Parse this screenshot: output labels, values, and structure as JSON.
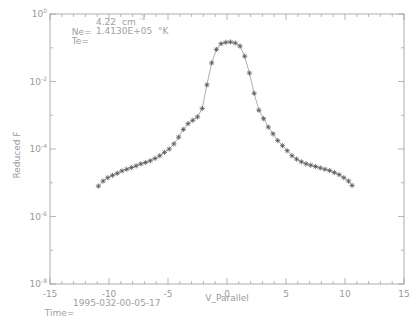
{
  "chart_data": {
    "type": "scatter",
    "title": "",
    "xlabel": "V_Parallel",
    "ylabel": "Reduced F",
    "xlim": [
      -15,
      15
    ],
    "ylim_log10": [
      -8,
      0
    ],
    "yscale": "log",
    "grid": false,
    "legend": null,
    "x_ticks": [
      -15,
      -10,
      -5,
      0,
      5,
      10,
      15
    ],
    "x_tick_labels": [
      "-15",
      "-10",
      "-5",
      "0",
      "5",
      "10",
      "15"
    ],
    "y_ticks_log10": [
      0,
      -2,
      -4,
      -6,
      -8
    ],
    "y_tick_labels": [
      "10^0",
      "10^-2",
      "10^-4",
      "10^-6",
      "10^-8"
    ],
    "annotations": {
      "ne_label": "Ne=",
      "ne_value": "4.22",
      "ne_unit": "cm",
      "ne_exp": "-3",
      "te_label": "Te=",
      "te_value": "1.4130E+05",
      "te_unit": "°K",
      "time_label": "Time=",
      "time_value": "1995-032-00-05-17"
    },
    "series": [
      {
        "name": "data",
        "marker": "asterisk",
        "line": true,
        "x": [
          -10.9,
          -10.5,
          -10.1,
          -9.7,
          -9.3,
          -8.9,
          -8.5,
          -8.1,
          -7.7,
          -7.3,
          -6.9,
          -6.5,
          -6.1,
          -5.7,
          -5.3,
          -4.9,
          -4.5,
          -4.1,
          -3.7,
          -3.3,
          -2.9,
          -2.5,
          -2.1,
          -1.7,
          -1.3,
          -0.9,
          -0.5,
          -0.1,
          0.3,
          0.7,
          1.1,
          1.5,
          1.9,
          2.3,
          2.7,
          3.1,
          3.5,
          3.9,
          4.3,
          4.7,
          5.1,
          5.5,
          5.9,
          6.3,
          6.7,
          7.1,
          7.5,
          7.9,
          8.3,
          8.7,
          9.1,
          9.5,
          9.9,
          10.3,
          10.6
        ],
        "log10_y": [
          -5.1,
          -4.95,
          -4.85,
          -4.78,
          -4.72,
          -4.65,
          -4.6,
          -4.55,
          -4.5,
          -4.44,
          -4.4,
          -4.35,
          -4.28,
          -4.2,
          -4.1,
          -4.0,
          -3.85,
          -3.65,
          -3.42,
          -3.25,
          -3.15,
          -3.05,
          -2.8,
          -2.1,
          -1.45,
          -1.05,
          -0.88,
          -0.84,
          -0.83,
          -0.86,
          -0.95,
          -1.25,
          -1.75,
          -2.35,
          -2.85,
          -3.1,
          -3.35,
          -3.55,
          -3.75,
          -3.9,
          -4.05,
          -4.2,
          -4.3,
          -4.38,
          -4.44,
          -4.48,
          -4.52,
          -4.56,
          -4.6,
          -4.64,
          -4.7,
          -4.76,
          -4.85,
          -4.95,
          -5.08
        ]
      }
    ]
  }
}
